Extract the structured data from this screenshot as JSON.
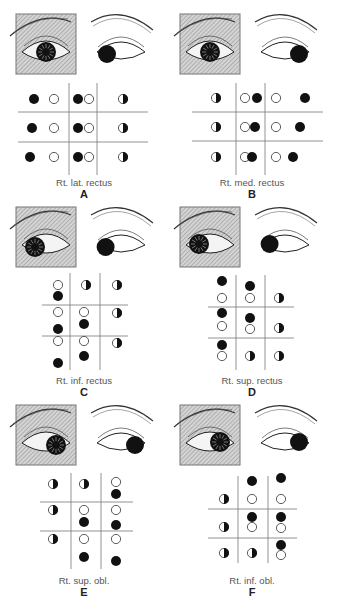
{
  "figure": {
    "panels": [
      {
        "letter": "A",
        "label": "Rt. lat. rectus",
        "x": 0,
        "y": 0,
        "grid": {
          "x0": 18,
          "x1": 148,
          "y0": 83,
          "y1": 175,
          "vx": [
            69,
            97
          ],
          "hy": [
            112,
            142
          ]
        },
        "iris_shaded": {
          "cx": 47,
          "cy": 50,
          "dir": "center"
        },
        "iris_fellow": {
          "dir": "left"
        },
        "dots": [
          {
            "x": 34,
            "y": 99,
            "t": "f"
          },
          {
            "x": 54,
            "y": 99,
            "t": "o"
          },
          {
            "x": 78,
            "y": 99,
            "t": "f"
          },
          {
            "x": 89,
            "y": 99,
            "t": "o"
          },
          {
            "x": 123,
            "y": 99,
            "t": "h"
          },
          {
            "x": 32,
            "y": 128,
            "t": "f"
          },
          {
            "x": 54,
            "y": 128,
            "t": "o"
          },
          {
            "x": 78,
            "y": 128,
            "t": "f"
          },
          {
            "x": 89,
            "y": 128,
            "t": "o"
          },
          {
            "x": 123,
            "y": 128,
            "t": "h"
          },
          {
            "x": 30,
            "y": 157,
            "t": "f"
          },
          {
            "x": 54,
            "y": 157,
            "t": "o"
          },
          {
            "x": 78,
            "y": 157,
            "t": "f"
          },
          {
            "x": 89,
            "y": 157,
            "t": "o"
          },
          {
            "x": 123,
            "y": 157,
            "t": "h"
          }
        ],
        "label_y": 177,
        "letter_y": 188
      },
      {
        "letter": "B",
        "label": "Rt. med. rectus",
        "x": 168,
        "y": 0,
        "grid": {
          "x0": 24,
          "x1": 155,
          "y0": 83,
          "y1": 175,
          "vx": [
            68,
            97
          ],
          "hy": [
            112,
            141
          ]
        },
        "iris_shaded": {
          "cx": 41,
          "cy": 49,
          "dir": "center"
        },
        "iris_fellow": {
          "dir": "right"
        },
        "dots": [
          {
            "x": 48,
            "y": 98,
            "t": "h"
          },
          {
            "x": 77,
            "y": 98,
            "t": "o"
          },
          {
            "x": 89,
            "y": 98,
            "t": "f"
          },
          {
            "x": 108,
            "y": 98,
            "t": "o"
          },
          {
            "x": 137,
            "y": 98,
            "t": "f"
          },
          {
            "x": 48,
            "y": 127,
            "t": "h"
          },
          {
            "x": 77,
            "y": 127,
            "t": "o"
          },
          {
            "x": 87,
            "y": 127,
            "t": "f"
          },
          {
            "x": 108,
            "y": 127,
            "t": "o"
          },
          {
            "x": 132,
            "y": 127,
            "t": "f"
          },
          {
            "x": 48,
            "y": 157,
            "t": "h"
          },
          {
            "x": 77,
            "y": 157,
            "t": "o"
          },
          {
            "x": 84,
            "y": 157,
            "t": "f"
          },
          {
            "x": 108,
            "y": 157,
            "t": "o"
          },
          {
            "x": 125,
            "y": 157,
            "t": "f"
          }
        ],
        "label_y": 177,
        "letter_y": 188
      },
      {
        "letter": "C",
        "label": "Rt. inf. rectus",
        "x": 0,
        "y": 195,
        "grid": {
          "x0": 42,
          "x1": 128,
          "y0": 78,
          "y1": 175,
          "vx": [
            70,
            100
          ],
          "hy": [
            110,
            141
          ]
        },
        "iris_shaded": {
          "cx": 34,
          "cy": 45,
          "dir": "downleft"
        },
        "iris_fellow": {
          "dir": "downleft"
        },
        "dots": [
          {
            "x": 58,
            "y": 90,
            "t": "o"
          },
          {
            "x": 58,
            "y": 101,
            "t": "f"
          },
          {
            "x": 86,
            "y": 90,
            "t": "h"
          },
          {
            "x": 117,
            "y": 90,
            "t": "h"
          },
          {
            "x": 58,
            "y": 117,
            "t": "o"
          },
          {
            "x": 58,
            "y": 134,
            "t": "f"
          },
          {
            "x": 84,
            "y": 117,
            "t": "o"
          },
          {
            "x": 84,
            "y": 129,
            "t": "f"
          },
          {
            "x": 117,
            "y": 118,
            "t": "h"
          },
          {
            "x": 58,
            "y": 146,
            "t": "o"
          },
          {
            "x": 58,
            "y": 168,
            "t": "f"
          },
          {
            "x": 84,
            "y": 146,
            "t": "o"
          },
          {
            "x": 84,
            "y": 161,
            "t": "f"
          },
          {
            "x": 117,
            "y": 148,
            "t": "h"
          }
        ],
        "label_y": 180,
        "letter_y": 191
      },
      {
        "letter": "D",
        "label": "Rt. sup. rectus",
        "x": 168,
        "y": 195,
        "grid": {
          "x0": 40,
          "x1": 126,
          "y0": 80,
          "y1": 175,
          "vx": [
            68,
            97
          ],
          "hy": [
            112,
            143
          ]
        },
        "iris_shaded": {
          "cx": 34,
          "cy": 48,
          "dir": "upleft"
        },
        "iris_fellow": {
          "dir": "upleft"
        },
        "dots": [
          {
            "x": 54,
            "y": 86,
            "t": "f"
          },
          {
            "x": 54,
            "y": 103,
            "t": "o"
          },
          {
            "x": 82,
            "y": 91,
            "t": "f"
          },
          {
            "x": 82,
            "y": 103,
            "t": "o"
          },
          {
            "x": 111,
            "y": 103,
            "t": "h"
          },
          {
            "x": 54,
            "y": 118,
            "t": "f"
          },
          {
            "x": 54,
            "y": 131,
            "t": "o"
          },
          {
            "x": 82,
            "y": 123,
            "t": "f"
          },
          {
            "x": 82,
            "y": 134,
            "t": "o"
          },
          {
            "x": 111,
            "y": 133,
            "t": "h"
          },
          {
            "x": 54,
            "y": 150,
            "t": "f"
          },
          {
            "x": 54,
            "y": 161,
            "t": "o"
          },
          {
            "x": 82,
            "y": 161,
            "t": "h"
          },
          {
            "x": 111,
            "y": 161,
            "t": "h"
          }
        ],
        "label_y": 180,
        "letter_y": 191
      },
      {
        "letter": "E",
        "label": "Rt. sup. obl.",
        "x": 0,
        "y": 400,
        "grid": {
          "x0": 40,
          "x1": 133,
          "y0": 73,
          "y1": 169,
          "vx": [
            71,
            101
          ],
          "hy": [
            102,
            131
          ]
        },
        "iris_shaded": {
          "cx": 57,
          "cy": 40,
          "dir": "downright"
        },
        "iris_fellow": {
          "dir": "downright"
        },
        "dots": [
          {
            "x": 53,
            "y": 84,
            "t": "h"
          },
          {
            "x": 84,
            "y": 84,
            "t": "h"
          },
          {
            "x": 116,
            "y": 82,
            "t": "o"
          },
          {
            "x": 116,
            "y": 94,
            "t": "f"
          },
          {
            "x": 53,
            "y": 110,
            "t": "h"
          },
          {
            "x": 84,
            "y": 110,
            "t": "o"
          },
          {
            "x": 84,
            "y": 122,
            "t": "f"
          },
          {
            "x": 116,
            "y": 110,
            "t": "o"
          },
          {
            "x": 116,
            "y": 125,
            "t": "f"
          },
          {
            "x": 53,
            "y": 139,
            "t": "h"
          },
          {
            "x": 84,
            "y": 139,
            "t": "o"
          },
          {
            "x": 84,
            "y": 157,
            "t": "f"
          },
          {
            "x": 116,
            "y": 139,
            "t": "o"
          },
          {
            "x": 116,
            "y": 161,
            "t": "f"
          }
        ],
        "label_y": 175,
        "letter_y": 186
      },
      {
        "letter": "F",
        "label": "Rt. inf. obl.",
        "x": 168,
        "y": 400,
        "grid": {
          "x0": 40,
          "x1": 129,
          "y0": 76,
          "y1": 163,
          "vx": [
            70,
            100
          ],
          "hy": [
            109,
            138
          ]
        },
        "iris_shaded": {
          "cx": 56,
          "cy": 41,
          "dir": "upright"
        },
        "iris_fellow": {
          "dir": "upright"
        },
        "dots": [
          {
            "x": 84,
            "y": 81,
            "t": "f"
          },
          {
            "x": 113,
            "y": 78,
            "t": "f"
          },
          {
            "x": 56,
            "y": 99,
            "t": "h"
          },
          {
            "x": 84,
            "y": 99,
            "t": "o"
          },
          {
            "x": 113,
            "y": 99,
            "t": "o"
          },
          {
            "x": 84,
            "y": 117,
            "t": "f"
          },
          {
            "x": 113,
            "y": 117,
            "t": "f"
          },
          {
            "x": 56,
            "y": 127,
            "t": "h"
          },
          {
            "x": 84,
            "y": 127,
            "t": "o"
          },
          {
            "x": 113,
            "y": 128,
            "t": "o"
          },
          {
            "x": 113,
            "y": 145,
            "t": "f"
          },
          {
            "x": 56,
            "y": 153,
            "t": "h"
          },
          {
            "x": 84,
            "y": 153,
            "t": "h"
          },
          {
            "x": 113,
            "y": 155,
            "t": "o"
          }
        ],
        "label_y": 175,
        "letter_y": 186
      }
    ]
  },
  "legend": {
    "f": "filled",
    "o": "open",
    "h": "half-filled"
  },
  "colors": {
    "ink": "#111111",
    "hatch": "#888888",
    "square": "#cfcfcf",
    "line": "#777777",
    "text": "#555555"
  }
}
